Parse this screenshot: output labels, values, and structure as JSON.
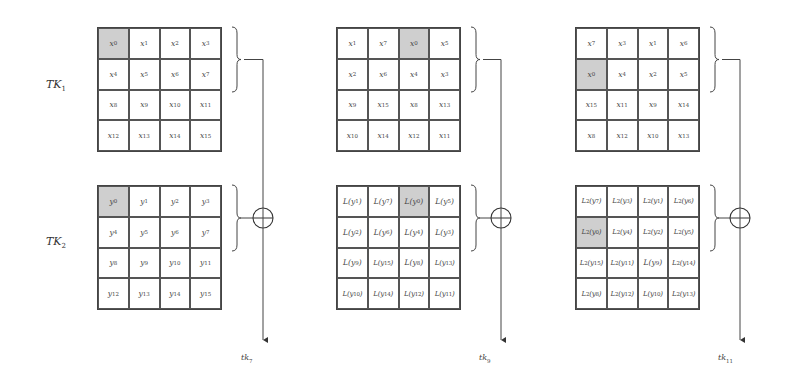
{
  "diagram": {
    "row_labels": {
      "tk1": {
        "main": "TK",
        "sub": "1"
      },
      "tk2": {
        "main": "TK",
        "sub": "2"
      }
    },
    "highlight_color": "#cfcfcf",
    "xor_symbol": "⊕",
    "columns": [
      {
        "output_label": "tk7",
        "tk1_grid": [
          [
            "x0",
            "x1",
            "x2",
            "x3"
          ],
          [
            "x4",
            "x5",
            "x6",
            "x7"
          ],
          [
            "x8",
            "x9",
            "x10",
            "x11"
          ],
          [
            "x12",
            "x13",
            "x14",
            "x15"
          ]
        ],
        "tk1_highlight": [
          0,
          0
        ],
        "tk2_grid": [
          [
            "y0",
            "y1",
            "y2",
            "y3"
          ],
          [
            "y4",
            "y5",
            "y6",
            "y7"
          ],
          [
            "y8",
            "y9",
            "y10",
            "y11"
          ],
          [
            "y12",
            "y13",
            "y14",
            "y15"
          ]
        ],
        "tk2_highlight": [
          0,
          0
        ]
      },
      {
        "output_label": "tk9",
        "tk1_grid": [
          [
            "x1",
            "x7",
            "x0",
            "x5"
          ],
          [
            "x2",
            "x6",
            "x4",
            "x3"
          ],
          [
            "x9",
            "x15",
            "x8",
            "x13"
          ],
          [
            "x10",
            "x14",
            "x12",
            "x11"
          ]
        ],
        "tk1_highlight": [
          0,
          2
        ],
        "tk2_grid": [
          [
            "L(y1)",
            "L(y7)",
            "L(y0)",
            "L(y5)"
          ],
          [
            "L(y2)",
            "L(y6)",
            "L(y4)",
            "L(y3)"
          ],
          [
            "L(y9)",
            "L(y15)",
            "L(y8)",
            "L(y13)"
          ],
          [
            "L(y10)",
            "L(y14)",
            "L(y12)",
            "L(y11)"
          ]
        ],
        "tk2_highlight": [
          0,
          2
        ]
      },
      {
        "output_label": "tk11",
        "tk1_grid": [
          [
            "x7",
            "x3",
            "x1",
            "x6"
          ],
          [
            "x0",
            "x4",
            "x2",
            "x5"
          ],
          [
            "x15",
            "x11",
            "x9",
            "x14"
          ],
          [
            "x8",
            "x12",
            "x10",
            "x13"
          ]
        ],
        "tk1_highlight": [
          1,
          0
        ],
        "tk2_grid": [
          [
            "L²(y7)",
            "L²(y3)",
            "L²(y1)",
            "L²(y6)"
          ],
          [
            "L²(y0)",
            "L²(y4)",
            "L²(y2)",
            "L²(y5)"
          ],
          [
            "L²(y15)",
            "L²(y11)",
            "L(y9)",
            "L²(y14)"
          ],
          [
            "L²(y8)",
            "L²(y12)",
            "L(y10)",
            "L²(y13)"
          ]
        ],
        "tk2_highlight": [
          1,
          0
        ]
      }
    ]
  }
}
